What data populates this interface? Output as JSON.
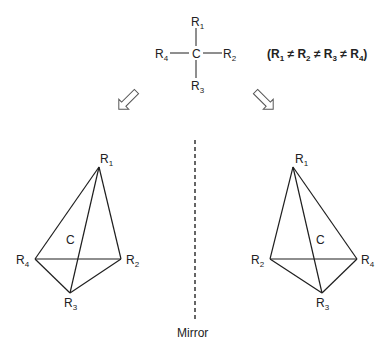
{
  "fischer": {
    "center": "C",
    "top": {
      "base": "R",
      "sub": "1"
    },
    "right": {
      "base": "R",
      "sub": "2"
    },
    "bottom": {
      "base": "R",
      "sub": "3"
    },
    "left": {
      "base": "R",
      "sub": "4"
    }
  },
  "condition": {
    "open": "(",
    "parts": [
      {
        "base": "R",
        "sub": "1"
      },
      {
        "base": "R",
        "sub": "2"
      },
      {
        "base": "R",
        "sub": "3"
      },
      {
        "base": "R",
        "sub": "4"
      }
    ],
    "neq": "≠",
    "close": ")"
  },
  "left_tetrahedron": {
    "center": "C",
    "apex": {
      "base": "R",
      "sub": "1"
    },
    "left": {
      "base": "R",
      "sub": "4"
    },
    "right": {
      "base": "R",
      "sub": "2"
    },
    "bottom": {
      "base": "R",
      "sub": "3"
    }
  },
  "right_tetrahedron": {
    "center": "C",
    "apex": {
      "base": "R",
      "sub": "1"
    },
    "left": {
      "base": "R",
      "sub": "2"
    },
    "right": {
      "base": "R",
      "sub": "4"
    },
    "bottom": {
      "base": "R",
      "sub": "3"
    }
  },
  "mirror": {
    "label": "Mirror"
  },
  "arrows": {
    "left": "hollow-arrow-down-left",
    "right": "hollow-arrow-down-right"
  },
  "colors": {
    "stroke": "#1e1e1e",
    "text": "#222222",
    "arrow": "#555555"
  }
}
